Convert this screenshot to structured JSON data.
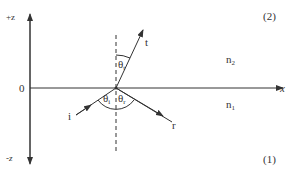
{
  "figure": {
    "axes": {
      "z_positive_label": "+z",
      "z_negative_label": "-z",
      "x_label": "x",
      "origin_label": "0"
    },
    "media": {
      "upper": {
        "region_label": "(2)",
        "index_symbol": "n",
        "index_subscript": "2"
      },
      "lower": {
        "region_label": "(1)",
        "index_symbol": "n",
        "index_subscript": "1"
      }
    },
    "rays": {
      "incident": {
        "label": "i"
      },
      "reflected": {
        "label": "r"
      },
      "transmitted": {
        "label": "t"
      }
    },
    "angles": {
      "incidence": {
        "symbol": "θ",
        "subscript": "i"
      },
      "reflection": {
        "symbol": "θ",
        "subscript": "r"
      },
      "transmission": {
        "symbol": "θ",
        "subscript": "t"
      }
    },
    "colors": {
      "line": "#333333",
      "background": "#ffffff"
    }
  }
}
